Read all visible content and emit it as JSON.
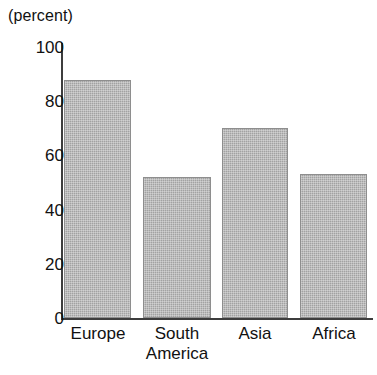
{
  "chart_data": {
    "type": "bar",
    "title": "",
    "subtitle": "",
    "xlabel": "",
    "ylabel": "(percent)",
    "categories": [
      "Europe",
      "South America",
      "Asia",
      "Africa"
    ],
    "category_lines": [
      [
        "Europe"
      ],
      [
        "South",
        "America"
      ],
      [
        "Asia"
      ],
      [
        "Africa"
      ]
    ],
    "values": [
      88,
      52,
      70,
      53
    ],
    "ylim": [
      0,
      100
    ],
    "ytick_labels": [
      "100",
      "80",
      "60",
      "40",
      "20",
      "0"
    ],
    "ytick_values": [
      100,
      80,
      60,
      40,
      20,
      0
    ],
    "grid": false,
    "legend": "none",
    "bar_fill_color": "#a9a9a9",
    "bar_border_color": "#8e8e8e",
    "axis_color": "#3d3d3d",
    "text_color": "#111111",
    "background_color": "#ffffff"
  },
  "axis": {
    "unit_caption": "(percent)"
  }
}
